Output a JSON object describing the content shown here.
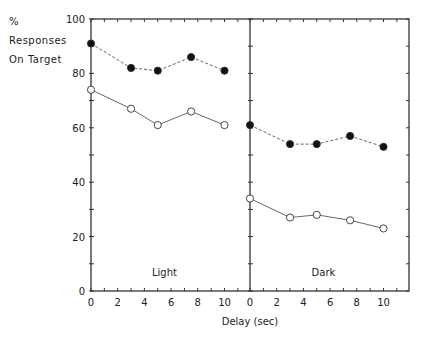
{
  "chart_data": {
    "type": "line",
    "ylabel": [
      "%",
      "Responses",
      "On Target"
    ],
    "xlabel": "Delay (sec)",
    "ylim": [
      0,
      100
    ],
    "yticks": [
      0,
      20,
      40,
      60,
      80,
      100
    ],
    "xticks": [
      0,
      2,
      4,
      6,
      8,
      10
    ],
    "panels": [
      {
        "label": "Light",
        "series": [
          {
            "name": "filled",
            "marker": "filled-circle",
            "style": "dashed",
            "x": [
              0,
              3,
              5,
              7.5,
              10
            ],
            "values": [
              91,
              82,
              81,
              86,
              81
            ]
          },
          {
            "name": "open",
            "marker": "open-circle",
            "style": "solid",
            "x": [
              0,
              3,
              5,
              7.5,
              10
            ],
            "values": [
              74,
              67,
              61,
              66,
              61
            ]
          }
        ]
      },
      {
        "label": "Dark",
        "series": [
          {
            "name": "filled",
            "marker": "filled-circle",
            "style": "dashed",
            "x": [
              0,
              3,
              5,
              7.5,
              10
            ],
            "values": [
              61,
              54,
              54,
              57,
              53
            ]
          },
          {
            "name": "open",
            "marker": "open-circle",
            "style": "solid",
            "x": [
              0,
              3,
              5,
              7.5,
              10
            ],
            "values": [
              34,
              27,
              28,
              26,
              23
            ]
          }
        ]
      }
    ]
  }
}
